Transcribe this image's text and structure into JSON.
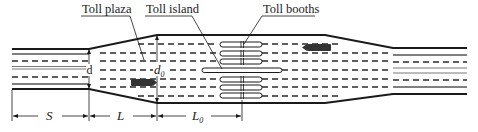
{
  "labels": {
    "toll_plaza": "Toll plaza",
    "toll_island": "Toll island",
    "toll_booths": "Toll booths"
  },
  "dimensions": {
    "S": "S",
    "L": "L",
    "L0_main": "L",
    "L0_sub": "0",
    "d": "d",
    "d0_main": "d",
    "d0_sub": "0"
  },
  "colors": {
    "line": "#1a1a1a",
    "background": "#ffffff",
    "vehicle": "#333333"
  },
  "layout": {
    "approach_lanes": 4,
    "plaza_lanes": 8,
    "toll_booths_per_side": 3,
    "vehicles_shown": 2
  }
}
